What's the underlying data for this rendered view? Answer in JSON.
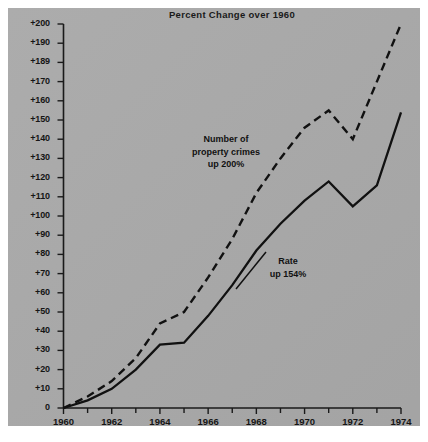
{
  "title": "Percent Change over 1960",
  "colors": {
    "panel_bg": "#a9a9a9",
    "page_bg": "#ffffff",
    "ink": "#111111",
    "axis": "#1a1a1a"
  },
  "axis": {
    "y_tick_labels": [
      "+200",
      "+190",
      "+189",
      "+170",
      "+160",
      "+150",
      "+140",
      "+130",
      "+120",
      "+110",
      "+100",
      "+90",
      "+80",
      "+70",
      "+60",
      "+50",
      "+40",
      "+30",
      "+20",
      "+10",
      "0"
    ],
    "x_tick_labels": [
      "1960",
      "1962",
      "1964",
      "1966",
      "1968",
      "1970",
      "1972",
      "1974"
    ],
    "x_minor_years": [
      "1961",
      "1963",
      "1965",
      "1967",
      "1969",
      "1971",
      "1973"
    ]
  },
  "annotations": {
    "property_crimes": {
      "line1": "Number of",
      "line2": "property crimes",
      "line3": "up 200%"
    },
    "rate": {
      "line1": "Rate",
      "line2": "up 154%"
    }
  },
  "chart_data": {
    "type": "line",
    "title": "Percent Change over 1960",
    "xlabel": "",
    "ylabel": "Percent Change over 1960",
    "xlim": [
      1960,
      1974
    ],
    "ylim": [
      0,
      200
    ],
    "grid": false,
    "legend": "annotations-inline",
    "x": [
      1960,
      1961,
      1962,
      1963,
      1964,
      1965,
      1966,
      1967,
      1968,
      1969,
      1970,
      1971,
      1972,
      1973,
      1974
    ],
    "ytick_values": [
      200,
      190,
      180,
      170,
      160,
      150,
      140,
      130,
      120,
      110,
      100,
      90,
      80,
      70,
      60,
      50,
      40,
      30,
      20,
      10,
      0
    ],
    "xtick_values": [
      1960,
      1962,
      1964,
      1966,
      1968,
      1970,
      1972,
      1974
    ],
    "series": [
      {
        "name": "Number of property crimes",
        "style": "dashed",
        "label": "Number of property crimes up 200%",
        "values": [
          0,
          6,
          14,
          26,
          44,
          50,
          68,
          88,
          112,
          130,
          146,
          155,
          140,
          170,
          200
        ]
      },
      {
        "name": "Rate",
        "style": "solid",
        "label": "Rate up 154%",
        "values": [
          0,
          4,
          10,
          20,
          33,
          34,
          48,
          64,
          82,
          96,
          108,
          118,
          105,
          116,
          154
        ]
      }
    ]
  }
}
